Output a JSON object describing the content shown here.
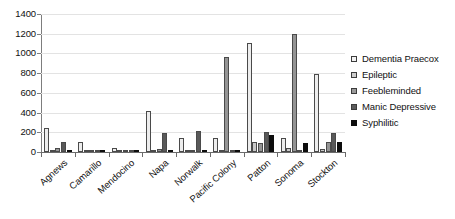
{
  "chart_data": {
    "type": "bar",
    "title": "",
    "xlabel": "",
    "ylabel": "",
    "ylim": [
      0,
      1400
    ],
    "ytick_step": 200,
    "yticks": [
      1400,
      1200,
      1000,
      800,
      600,
      400,
      200,
      0
    ],
    "grid": true,
    "legend_position": "right",
    "orientation": "vertical",
    "grouping": "clustered",
    "categories": [
      "Agnews",
      "Camarillo",
      "Mendocino",
      "Napa",
      "Norwalk",
      "Pacific Colony",
      "Patton",
      "Sonoma",
      "Stockton"
    ],
    "series": [
      {
        "name": "Dementia Praecox",
        "color": "#ededed",
        "values": [
          240,
          100,
          45,
          420,
          140,
          145,
          1110,
          145,
          790
        ]
      },
      {
        "name": "Epileptic",
        "color": "#c9c9c9",
        "values": [
          15,
          12,
          8,
          20,
          5,
          8,
          100,
          45,
          30
        ]
      },
      {
        "name": "Feebleminded",
        "color": "#949494",
        "values": [
          45,
          10,
          5,
          28,
          20,
          960,
          95,
          1200,
          100
        ]
      },
      {
        "name": "Manic Depressive",
        "color": "#595959",
        "values": [
          105,
          5,
          8,
          190,
          210,
          5,
          205,
          5,
          190
        ]
      },
      {
        "name": "Syphilitic",
        "color": "#0d0d0d",
        "values": [
          5,
          3,
          3,
          5,
          5,
          20,
          175,
          90,
          105
        ]
      }
    ]
  },
  "legend": {
    "items": [
      {
        "label": "Dementia Praecox"
      },
      {
        "label": "Epileptic"
      },
      {
        "label": "Feebleminded"
      },
      {
        "label": "Manic Depressive"
      },
      {
        "label": "Syphilitic"
      }
    ]
  }
}
